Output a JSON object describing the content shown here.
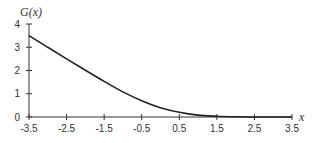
{
  "chart_data": {
    "type": "line",
    "title": "",
    "xlabel": "x",
    "ylabel": "G(x)",
    "xlim": [
      -3.5,
      3.5
    ],
    "ylim": [
      0,
      4
    ],
    "grid": false,
    "legend": null,
    "x_ticks": [
      "-3.5",
      "-2.5",
      "-1.5",
      "-0.5",
      "0.5",
      "1.5",
      "2.5",
      "3.5"
    ],
    "y_ticks": [
      "0",
      "1",
      "2",
      "3",
      "4"
    ],
    "series": [
      {
        "name": "G(x)",
        "x": [
          -3.5,
          -3.0,
          -2.5,
          -2.0,
          -1.5,
          -1.0,
          -0.5,
          0.0,
          0.5,
          1.0,
          1.5,
          2.0,
          2.5,
          3.0,
          3.5
        ],
        "values": [
          3.5,
          3.0,
          2.5,
          2.01,
          1.53,
          1.08,
          0.7,
          0.4,
          0.2,
          0.08,
          0.03,
          0.01,
          0.0,
          0.0,
          0.0
        ]
      }
    ]
  }
}
